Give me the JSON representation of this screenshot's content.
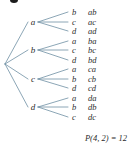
{
  "figure": {
    "kind": "permutation-tree-diagram",
    "root": {
      "label": "",
      "x": 5,
      "y": 64
    },
    "line_color": "#6f8fa3",
    "text_color": "#2d2d2d",
    "background": "#ffffff",
    "first_letters": [
      "a",
      "b",
      "c",
      "d"
    ],
    "branches": [
      {
        "first": "a",
        "node_x": 33,
        "node_y": 22,
        "children": [
          {
            "second": "b",
            "outcome": "ab",
            "y": 12
          },
          {
            "second": "c",
            "outcome": "ac",
            "y": 22
          },
          {
            "second": "d",
            "outcome": "ad",
            "y": 31
          }
        ]
      },
      {
        "first": "b",
        "node_x": 33,
        "node_y": 50,
        "children": [
          {
            "second": "a",
            "outcome": "ba",
            "y": 41
          },
          {
            "second": "c",
            "outcome": "bc",
            "y": 50
          },
          {
            "second": "d",
            "outcome": "bd",
            "y": 60
          }
        ]
      },
      {
        "first": "c",
        "node_x": 33,
        "node_y": 79,
        "children": [
          {
            "second": "a",
            "outcome": "ca",
            "y": 69
          },
          {
            "second": "b",
            "outcome": "cb",
            "y": 79
          },
          {
            "second": "d",
            "outcome": "cd",
            "y": 88
          }
        ]
      },
      {
        "first": "d",
        "node_x": 33,
        "node_y": 107,
        "children": [
          {
            "second": "a",
            "outcome": "da",
            "y": 98
          },
          {
            "second": "b",
            "outcome": "db",
            "y": 107
          },
          {
            "second": "c",
            "outcome": "dc",
            "y": 117
          }
        ]
      }
    ],
    "leaf_letter_x": 72,
    "leaf_outcome_x": 88,
    "caption": "P(4, 2) = 12"
  }
}
